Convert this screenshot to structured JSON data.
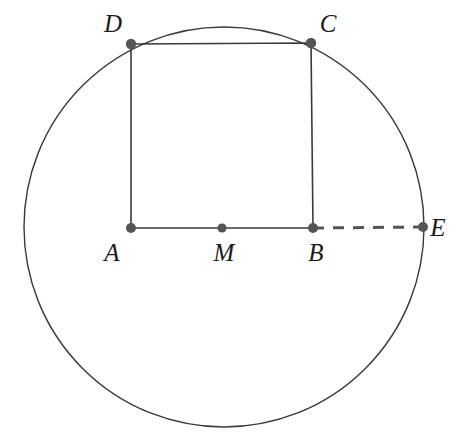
{
  "figure": {
    "background_color": "#ffffff",
    "stroke_color": "#3a3a3a",
    "point_color": "#555555",
    "label_color": "#1a1a1a",
    "dash_color": "#555555",
    "width": 465,
    "height": 448,
    "cut_caption": "",
    "circle": {
      "name": "circumscribed-circle",
      "cx": 224,
      "cy": 227,
      "r": 200,
      "stroke_width": 1.4
    },
    "square": {
      "name": "square-abcd",
      "vertices": [
        "A",
        "B",
        "C",
        "D"
      ],
      "path": "M 131 228 L 313 228 L 311 43 L 131 44 Z",
      "side_length": 182,
      "stroke_width": 1.6
    },
    "segment_be": {
      "name": "segment-b-to-e",
      "x1": 313,
      "y1": 228,
      "x2": 423,
      "y2": 227,
      "style": "dashed",
      "dash_pattern": "11 9",
      "stroke_width": 3
    },
    "points": [
      {
        "id": "A",
        "label": "A",
        "x": 131,
        "y": 228,
        "r": 5.0,
        "label_x": 112,
        "label_y": 261
      },
      {
        "id": "M",
        "label": "M",
        "x": 222,
        "y": 228,
        "r": 4.6,
        "label_x": 219,
        "label_y": 261
      },
      {
        "id": "B",
        "label": "B",
        "x": 313,
        "y": 228,
        "r": 5.0,
        "label_x": 310,
        "label_y": 261
      },
      {
        "id": "C",
        "label": "C",
        "x": 311,
        "y": 43,
        "r": 5.2,
        "label_x": 322,
        "label_y": 32
      },
      {
        "id": "D",
        "label": "D",
        "x": 131,
        "y": 44,
        "r": 5.2,
        "label_x": 105,
        "label_y": 32
      },
      {
        "id": "E",
        "label": "E",
        "x": 423,
        "y": 227,
        "r": 5.0,
        "label_x": 431,
        "label_y": 235
      }
    ]
  }
}
